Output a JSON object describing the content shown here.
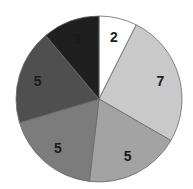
{
  "chart_data": {
    "type": "pie",
    "title": "",
    "start_angle_deg": 0,
    "direction": "clockwise",
    "slices": [
      {
        "label": "2",
        "value": 2,
        "color": "#ffffff"
      },
      {
        "label": "7",
        "value": 7,
        "color": "#c9c9c9"
      },
      {
        "label": "5",
        "value": 5,
        "color": "#a3a3a3"
      },
      {
        "label": "5",
        "value": 5,
        "color": "#7c7c7c"
      },
      {
        "label": "5",
        "value": 5,
        "color": "#4f4f4f"
      },
      {
        "label": "3",
        "value": 3,
        "color": "#1f1f1f"
      }
    ],
    "values": [
      2,
      7,
      5,
      5,
      5,
      3
    ],
    "legend": false,
    "data_labels": true
  }
}
